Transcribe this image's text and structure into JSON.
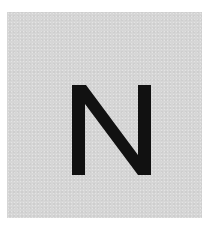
{
  "card": {
    "background_color": "#d6d6d6",
    "letter": "N",
    "letter_color": "#111111"
  }
}
